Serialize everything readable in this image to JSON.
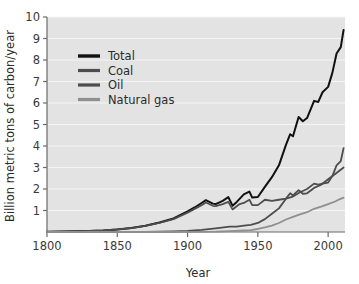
{
  "chart_data": {
    "type": "line",
    "title": "",
    "xlabel": "Year",
    "ylabel": "Billion metric tons of carbon/year",
    "xlim": [
      1800,
      2012
    ],
    "ylim": [
      0,
      10
    ],
    "xticks": [
      1800,
      1850,
      1900,
      1950,
      2000
    ],
    "yticks": [
      1,
      2,
      3,
      4,
      5,
      6,
      7,
      8,
      9,
      10
    ],
    "grid": "horizontal-white-on-gray",
    "legend_position": "upper-left-inside",
    "plot_background": "#e3e3e3",
    "gridline_color": "#f5f5f5",
    "series": [
      {
        "name": "Total",
        "color": "#111111",
        "width": 2.0,
        "x": [
          1800,
          1810,
          1820,
          1830,
          1840,
          1850,
          1860,
          1870,
          1880,
          1890,
          1900,
          1905,
          1910,
          1913,
          1918,
          1920,
          1925,
          1929,
          1932,
          1935,
          1940,
          1944,
          1946,
          1950,
          1955,
          1960,
          1965,
          1970,
          1973,
          1975,
          1979,
          1982,
          1985,
          1990,
          1993,
          1996,
          2000,
          2003,
          2006,
          2009,
          2011
        ],
        "values": [
          0.01,
          0.02,
          0.03,
          0.05,
          0.07,
          0.12,
          0.19,
          0.29,
          0.44,
          0.63,
          0.96,
          1.14,
          1.35,
          1.48,
          1.32,
          1.3,
          1.45,
          1.62,
          1.22,
          1.4,
          1.75,
          1.88,
          1.6,
          1.63,
          2.1,
          2.55,
          3.1,
          4.05,
          4.55,
          4.45,
          5.35,
          5.15,
          5.3,
          6.1,
          6.05,
          6.5,
          6.75,
          7.4,
          8.3,
          8.6,
          9.4
        ]
      },
      {
        "name": "Coal",
        "color": "#4d4d4d",
        "width": 1.8,
        "x": [
          1800,
          1820,
          1840,
          1850,
          1860,
          1870,
          1880,
          1890,
          1900,
          1910,
          1913,
          1918,
          1920,
          1925,
          1929,
          1932,
          1937,
          1940,
          1944,
          1946,
          1950,
          1955,
          1960,
          1965,
          1970,
          1975,
          1980,
          1985,
          1990,
          1993,
          1996,
          2000,
          2003,
          2006,
          2009,
          2011
        ],
        "values": [
          0.01,
          0.03,
          0.07,
          0.12,
          0.18,
          0.28,
          0.42,
          0.6,
          0.9,
          1.25,
          1.37,
          1.22,
          1.2,
          1.3,
          1.4,
          1.05,
          1.3,
          1.35,
          1.5,
          1.25,
          1.25,
          1.5,
          1.45,
          1.5,
          1.55,
          1.65,
          1.85,
          2.0,
          2.25,
          2.2,
          2.25,
          2.3,
          2.6,
          3.1,
          3.3,
          3.9
        ]
      },
      {
        "name": "Oil",
        "color": "#4d4d4d",
        "width": 1.8,
        "x": [
          1800,
          1860,
          1870,
          1880,
          1890,
          1900,
          1910,
          1920,
          1930,
          1935,
          1940,
          1945,
          1950,
          1955,
          1960,
          1965,
          1970,
          1973,
          1975,
          1979,
          1982,
          1985,
          1990,
          1995,
          2000,
          2005,
          2008,
          2011
        ],
        "values": [
          0.0,
          0.0,
          0.01,
          0.02,
          0.03,
          0.05,
          0.1,
          0.17,
          0.25,
          0.25,
          0.3,
          0.33,
          0.42,
          0.6,
          0.85,
          1.1,
          1.55,
          1.8,
          1.7,
          1.95,
          1.78,
          1.8,
          2.05,
          2.2,
          2.45,
          2.7,
          2.85,
          3.0
        ]
      },
      {
        "name": "Natural gas",
        "color": "#8f8f8f",
        "width": 1.8,
        "x": [
          1800,
          1880,
          1900,
          1920,
          1930,
          1940,
          1945,
          1950,
          1955,
          1960,
          1965,
          1970,
          1975,
          1980,
          1985,
          1990,
          1995,
          2000,
          2005,
          2008,
          2011
        ],
        "values": [
          0.0,
          0.0,
          0.01,
          0.02,
          0.04,
          0.07,
          0.09,
          0.14,
          0.21,
          0.3,
          0.42,
          0.58,
          0.7,
          0.82,
          0.92,
          1.08,
          1.18,
          1.3,
          1.42,
          1.52,
          1.6
        ]
      }
    ]
  },
  "legend": {
    "items": [
      {
        "label": "Total"
      },
      {
        "label": "Coal"
      },
      {
        "label": "Oil"
      },
      {
        "label": "Natural gas"
      }
    ]
  }
}
